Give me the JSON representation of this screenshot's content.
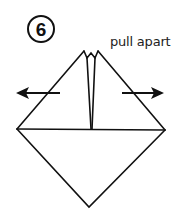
{
  "step": {
    "number": "6"
  },
  "instruction": {
    "label": "pull apart"
  },
  "diagram": {
    "stroke_color": "#111111",
    "arrows": [
      {
        "direction": "left",
        "icon": "arrow-left-icon"
      },
      {
        "direction": "right",
        "icon": "arrow-right-icon"
      }
    ]
  }
}
